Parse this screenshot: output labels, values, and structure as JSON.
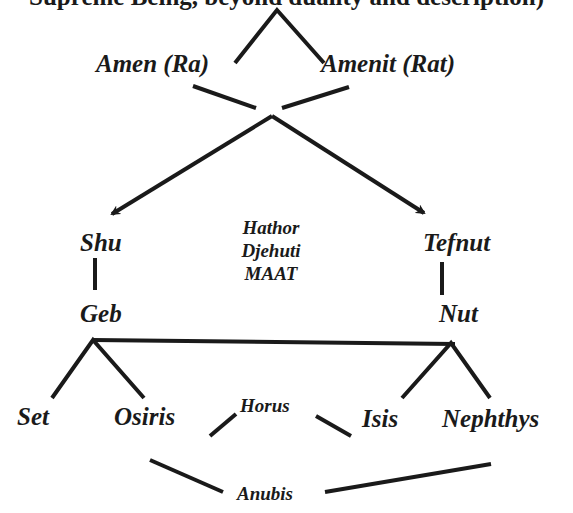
{
  "diagram": {
    "header_text_clipped": "Supreme Being, beyond duality and description)",
    "nodes": {
      "amen": "Amen  (Ra)",
      "amenit": "Amenit (Rat)",
      "shu": "Shu",
      "tefnut": "Tefnut",
      "center_deities": [
        "Hathor",
        "Djehuti",
        "MAAT"
      ],
      "geb": "Geb",
      "nut": "Nut",
      "set": "Set",
      "osiris": "Osiris",
      "horus": "Horus",
      "isis": "Isis",
      "nephthys": "Nephthys",
      "anubis": "Anubis"
    },
    "line_color": "#1a1a1a"
  }
}
